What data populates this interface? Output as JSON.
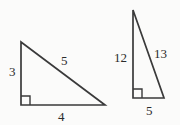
{
  "figure": {
    "kind": "geometry-figure",
    "background_color": "#fbfbfa",
    "stroke_color": "#3a3a3a",
    "text_color": "#2b2b2b"
  },
  "triangles": [
    {
      "id": "triangle-left",
      "name": "3-4-5 right triangle",
      "vertices": {
        "apex": [
          21,
          42
        ],
        "right_angle": [
          21,
          105
        ],
        "base_end": [
          105,
          105
        ]
      },
      "right_angle_marker": {
        "corner": [
          21,
          105
        ],
        "size": 9
      },
      "labels": {
        "vertical_leg": "3",
        "hypotenuse": "5",
        "base": "4"
      }
    },
    {
      "id": "triangle-right",
      "name": "5-12-13 right triangle",
      "vertices": {
        "apex": [
          133,
          10
        ],
        "right_angle": [
          133,
          98
        ],
        "base_end": [
          164,
          98
        ]
      },
      "right_angle_marker": {
        "corner": [
          133,
          98
        ],
        "size": 9
      },
      "labels": {
        "vertical_leg": "12",
        "hypotenuse": "13",
        "base": "5"
      }
    }
  ]
}
